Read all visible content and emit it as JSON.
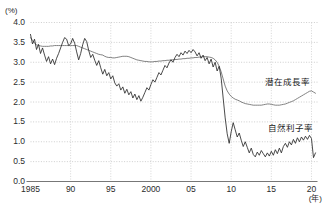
{
  "chart_data": {
    "type": "line",
    "title": "",
    "xlabel": "(年)",
    "ylabel": "(%)",
    "ylim": [
      0.0,
      4.0
    ],
    "xlim": [
      1985,
      2020.75
    ],
    "grid": true,
    "grid_style": "dotted-horizontal",
    "legend_position": "inline-right",
    "ytick_labels": [
      "0.0",
      "0.5",
      "1.0",
      "1.5",
      "2.0",
      "2.5",
      "3.0",
      "3.5",
      "4.0"
    ],
    "ytick_values": [
      0.0,
      0.5,
      1.0,
      1.5,
      2.0,
      2.5,
      3.0,
      3.5,
      4.0
    ],
    "xtick_labels": [
      "1985",
      "90",
      "95",
      "2000",
      "05",
      "10",
      "15",
      "20"
    ],
    "xtick_values": [
      1985,
      1990,
      1995,
      2000,
      2005,
      2010,
      2015,
      2020
    ],
    "series": [
      {
        "name": "潜在成長率",
        "color": "#6b6b6b",
        "label_x": 2014.2,
        "label_y": 2.52,
        "x": [
          1985.0,
          1985.25,
          1985.5,
          1985.75,
          1986.0,
          1986.25,
          1986.5,
          1986.75,
          1987.0,
          1987.25,
          1987.5,
          1987.75,
          1988.0,
          1988.25,
          1988.5,
          1988.75,
          1989.0,
          1989.25,
          1989.5,
          1989.75,
          1990.0,
          1990.25,
          1990.5,
          1990.75,
          1991.0,
          1991.25,
          1991.5,
          1991.75,
          1992.0,
          1992.25,
          1992.5,
          1992.75,
          1993.0,
          1993.25,
          1993.5,
          1993.75,
          1994.0,
          1994.25,
          1994.5,
          1994.75,
          1995.0,
          1995.25,
          1995.5,
          1995.75,
          1996.0,
          1996.25,
          1996.5,
          1996.75,
          1997.0,
          1997.25,
          1997.5,
          1997.75,
          1998.0,
          1998.25,
          1998.5,
          1998.75,
          1999.0,
          1999.25,
          1999.5,
          1999.75,
          2000.0,
          2000.25,
          2000.5,
          2000.75,
          2001.0,
          2001.25,
          2001.5,
          2001.75,
          2002.0,
          2002.25,
          2002.5,
          2002.75,
          2003.0,
          2003.25,
          2003.5,
          2003.75,
          2004.0,
          2004.25,
          2004.5,
          2004.75,
          2005.0,
          2005.25,
          2005.5,
          2005.75,
          2006.0,
          2006.25,
          2006.5,
          2006.75,
          2007.0,
          2007.25,
          2007.5,
          2007.75,
          2008.0,
          2008.25,
          2008.5,
          2008.75,
          2009.0,
          2009.25,
          2009.5,
          2009.75,
          2010.0,
          2010.25,
          2010.5,
          2010.75,
          2011.0,
          2011.25,
          2011.5,
          2011.75,
          2012.0,
          2012.25,
          2012.5,
          2012.75,
          2013.0,
          2013.25,
          2013.5,
          2013.75,
          2014.0,
          2014.25,
          2014.5,
          2014.75,
          2015.0,
          2015.25,
          2015.5,
          2015.75,
          2016.0,
          2016.25,
          2016.5,
          2016.75,
          2017.0,
          2017.25,
          2017.5,
          2017.75,
          2018.0,
          2018.25,
          2018.5,
          2018.75,
          2019.0,
          2019.25,
          2019.5,
          2019.75,
          2020.0,
          2020.25,
          2020.5
        ],
        "values": [
          3.62,
          3.55,
          3.48,
          3.44,
          3.42,
          3.41,
          3.4,
          3.4,
          3.4,
          3.4,
          3.41,
          3.41,
          3.42,
          3.42,
          3.42,
          3.42,
          3.42,
          3.42,
          3.42,
          3.42,
          3.42,
          3.42,
          3.42,
          3.42,
          3.4,
          3.38,
          3.36,
          3.34,
          3.32,
          3.3,
          3.28,
          3.26,
          3.24,
          3.22,
          3.2,
          3.19,
          3.18,
          3.15,
          3.13,
          3.12,
          3.12,
          3.11,
          3.11,
          3.12,
          3.13,
          3.14,
          3.15,
          3.15,
          3.15,
          3.14,
          3.12,
          3.1,
          3.08,
          3.06,
          3.05,
          3.04,
          3.03,
          3.02,
          3.02,
          3.01,
          3.01,
          3.01,
          3.02,
          3.02,
          3.03,
          3.03,
          3.04,
          3.04,
          3.05,
          3.05,
          3.06,
          3.06,
          3.07,
          3.07,
          3.08,
          3.08,
          3.09,
          3.09,
          3.1,
          3.1,
          3.11,
          3.11,
          3.12,
          3.12,
          3.13,
          3.13,
          3.14,
          3.14,
          3.14,
          3.13,
          3.12,
          3.1,
          3.06,
          3.0,
          2.9,
          2.76,
          2.58,
          2.4,
          2.28,
          2.2,
          2.14,
          2.1,
          2.07,
          2.05,
          2.03,
          2.0,
          1.98,
          1.96,
          1.95,
          1.94,
          1.93,
          1.92,
          1.92,
          1.92,
          1.92,
          1.92,
          1.93,
          1.94,
          1.95,
          1.95,
          1.94,
          1.93,
          1.92,
          1.92,
          1.92,
          1.93,
          1.94,
          1.95,
          1.97,
          1.99,
          2.01,
          2.03,
          2.06,
          2.09,
          2.12,
          2.15,
          2.18,
          2.21,
          2.24,
          2.27,
          2.28,
          2.25,
          2.22
        ]
      },
      {
        "name": "自然利子率",
        "color": "#2a2a2a",
        "label_x": 2014.6,
        "label_y": 1.38,
        "x": [
          1985.0,
          1985.25,
          1985.5,
          1985.75,
          1986.0,
          1986.25,
          1986.5,
          1986.75,
          1987.0,
          1987.25,
          1987.5,
          1987.75,
          1988.0,
          1988.25,
          1988.5,
          1988.75,
          1989.0,
          1989.25,
          1989.5,
          1989.75,
          1990.0,
          1990.25,
          1990.5,
          1990.75,
          1991.0,
          1991.25,
          1991.5,
          1991.75,
          1992.0,
          1992.25,
          1992.5,
          1992.75,
          1993.0,
          1993.25,
          1993.5,
          1993.75,
          1994.0,
          1994.25,
          1994.5,
          1994.75,
          1995.0,
          1995.25,
          1995.5,
          1995.75,
          1996.0,
          1996.25,
          1996.5,
          1996.75,
          1997.0,
          1997.25,
          1997.5,
          1997.75,
          1998.0,
          1998.25,
          1998.5,
          1998.75,
          1999.0,
          1999.25,
          1999.5,
          1999.75,
          2000.0,
          2000.25,
          2000.5,
          2000.75,
          2001.0,
          2001.25,
          2001.5,
          2001.75,
          2002.0,
          2002.25,
          2002.5,
          2002.75,
          2003.0,
          2003.25,
          2003.5,
          2003.75,
          2004.0,
          2004.25,
          2004.5,
          2004.75,
          2005.0,
          2005.25,
          2005.5,
          2005.75,
          2006.0,
          2006.25,
          2006.5,
          2006.75,
          2007.0,
          2007.25,
          2007.5,
          2007.75,
          2008.0,
          2008.25,
          2008.5,
          2008.75,
          2009.0,
          2009.25,
          2009.5,
          2009.75,
          2010.0,
          2010.25,
          2010.5,
          2010.75,
          2011.0,
          2011.25,
          2011.5,
          2011.75,
          2012.0,
          2012.25,
          2012.5,
          2012.75,
          2013.0,
          2013.25,
          2013.5,
          2013.75,
          2014.0,
          2014.25,
          2014.5,
          2014.75,
          2015.0,
          2015.25,
          2015.5,
          2015.75,
          2016.0,
          2016.25,
          2016.5,
          2016.75,
          2017.0,
          2017.25,
          2017.5,
          2017.75,
          2018.0,
          2018.25,
          2018.5,
          2018.75,
          2019.0,
          2019.25,
          2019.5,
          2019.75,
          2020.0,
          2020.25,
          2020.5
        ],
        "values": [
          3.7,
          3.46,
          3.58,
          3.32,
          3.45,
          3.22,
          3.36,
          3.18,
          3.02,
          3.14,
          2.96,
          3.08,
          2.94,
          3.1,
          3.22,
          3.36,
          3.5,
          3.62,
          3.58,
          3.42,
          3.46,
          3.6,
          3.48,
          3.26,
          3.06,
          3.22,
          3.44,
          3.6,
          3.52,
          3.3,
          3.12,
          3.2,
          3.05,
          2.92,
          3.04,
          2.86,
          2.7,
          2.82,
          2.66,
          2.74,
          2.58,
          2.66,
          2.48,
          2.4,
          2.46,
          2.3,
          2.38,
          2.22,
          2.32,
          2.18,
          2.26,
          2.1,
          2.2,
          2.06,
          2.16,
          2.02,
          2.12,
          2.24,
          2.36,
          2.3,
          2.44,
          2.56,
          2.5,
          2.62,
          2.74,
          2.68,
          2.8,
          2.92,
          2.86,
          2.98,
          3.06,
          3.0,
          3.12,
          3.2,
          3.14,
          3.24,
          3.18,
          3.28,
          3.22,
          3.3,
          3.24,
          3.32,
          3.26,
          3.16,
          3.24,
          3.1,
          3.18,
          3.04,
          3.12,
          2.96,
          3.08,
          2.88,
          3.0,
          2.78,
          2.9,
          2.6,
          2.1,
          1.6,
          1.2,
          0.96,
          1.25,
          1.48,
          1.3,
          1.12,
          1.22,
          1.04,
          0.88,
          1.0,
          0.86,
          0.72,
          0.84,
          0.68,
          0.62,
          0.74,
          0.66,
          0.78,
          0.7,
          0.62,
          0.72,
          0.64,
          0.76,
          0.66,
          0.8,
          0.7,
          0.84,
          0.72,
          0.88,
          0.96,
          0.86,
          1.0,
          0.92,
          1.06,
          0.96,
          1.1,
          1.0,
          1.12,
          1.04,
          1.14,
          1.06,
          1.16,
          1.08,
          0.6,
          0.72
        ]
      }
    ]
  }
}
